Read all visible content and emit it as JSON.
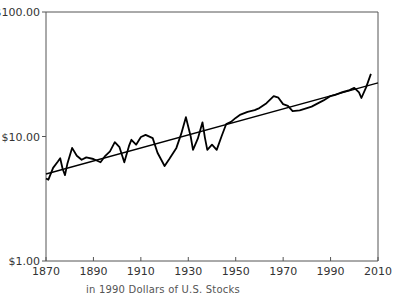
{
  "chart_data": {
    "type": "line",
    "title": "",
    "caption": "Real Price Index (in 1990 Dollars) of U.S. Stocks",
    "caption_visible": "in 1990 Dollars of U.S. Stocks",
    "xlabel": "",
    "ylabel": "",
    "yscale": "log",
    "xlim": [
      1870,
      2010
    ],
    "ylim": [
      1,
      100
    ],
    "grid": false,
    "legend": "none",
    "x_ticks": [
      "1870",
      "1890",
      "1910",
      "1930",
      "1950",
      "1970",
      "1990",
      "2010"
    ],
    "y_ticks": [
      "$1.00",
      "$10.00",
      "$100.00"
    ],
    "series": [
      {
        "name": "Real stock price index",
        "color": "#000000",
        "x": [
          1870,
          1871,
          1873,
          1875,
          1876,
          1877,
          1878,
          1879,
          1881,
          1883,
          1885,
          1887,
          1890,
          1893,
          1895,
          1897,
          1899,
          1901,
          1903,
          1905,
          1906,
          1908,
          1910,
          1912,
          1915,
          1917,
          1920,
          1922,
          1925,
          1927,
          1929,
          1931,
          1932,
          1934,
          1936,
          1937,
          1938,
          1940,
          1942,
          1944,
          1946,
          1948,
          1950,
          1952,
          1955,
          1958,
          1960,
          1963,
          1966,
          1968,
          1970,
          1972,
          1974,
          1977,
          1980,
          1982,
          1985,
          1987,
          1990,
          1992,
          1995,
          1998,
          2000,
          2002,
          2003,
          2005,
          2007
        ],
        "values": [
          4.6,
          4.5,
          5.6,
          6.3,
          6.7,
          5.5,
          4.9,
          6.0,
          8.1,
          7.0,
          6.5,
          6.8,
          6.6,
          6.2,
          7.0,
          7.6,
          9.0,
          8.2,
          6.2,
          8.4,
          9.4,
          8.6,
          9.9,
          10.3,
          9.7,
          7.4,
          5.8,
          6.6,
          8.1,
          10.5,
          14.3,
          10.0,
          7.8,
          9.6,
          13.0,
          9.8,
          7.8,
          8.6,
          7.8,
          10.0,
          12.6,
          13.1,
          14.1,
          15.0,
          15.8,
          16.3,
          16.9,
          18.5,
          21.1,
          20.5,
          18.2,
          17.6,
          16.0,
          16.2,
          16.9,
          17.4,
          18.6,
          19.5,
          21.1,
          21.6,
          22.7,
          23.6,
          24.6,
          22.6,
          20.4,
          24.8,
          31.8
        ]
      },
      {
        "name": "Trend line",
        "color": "#000000",
        "x": [
          1870,
          2010
        ],
        "values": [
          5.0,
          27.0
        ]
      }
    ]
  },
  "axes": {
    "y_labels": [
      {
        "text": "$100.00",
        "value": 100
      },
      {
        "text": "$10.00",
        "value": 10
      },
      {
        "text": "$1.00",
        "value": 1
      }
    ],
    "x_labels": [
      {
        "text": "1870",
        "value": 1870
      },
      {
        "text": "1890",
        "value": 1890
      },
      {
        "text": "1910",
        "value": 1910
      },
      {
        "text": "1930",
        "value": 1930
      },
      {
        "text": "1950",
        "value": 1950
      },
      {
        "text": "1970",
        "value": 1970
      },
      {
        "text": "1990",
        "value": 1990
      },
      {
        "text": "2010",
        "value": 2010
      }
    ]
  },
  "caption": {
    "text": "Real Price Index (in 1990 Dollars) of U.S. Stocks"
  }
}
